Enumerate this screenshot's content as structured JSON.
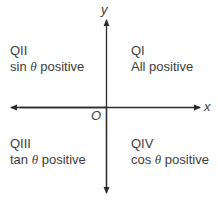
{
  "axes": {
    "x_label": "x",
    "y_label": "y",
    "origin_label": "O"
  },
  "quadrants": [
    {
      "id": "QI",
      "name": "QI",
      "rule_prefix": "",
      "theta": "",
      "rule_suffix": "All positive"
    },
    {
      "id": "QII",
      "name": "QII",
      "rule_prefix": "sin",
      "theta": "θ",
      "rule_suffix": " positive"
    },
    {
      "id": "QIII",
      "name": "QIII",
      "rule_prefix": "tan",
      "theta": "θ",
      "rule_suffix": " positive"
    },
    {
      "id": "QIV",
      "name": "QIV",
      "rule_prefix": "cos",
      "theta": "θ",
      "rule_suffix": " positive"
    }
  ],
  "colors": {
    "stroke": "#2b2b2b",
    "text": "#3d3d3d"
  }
}
